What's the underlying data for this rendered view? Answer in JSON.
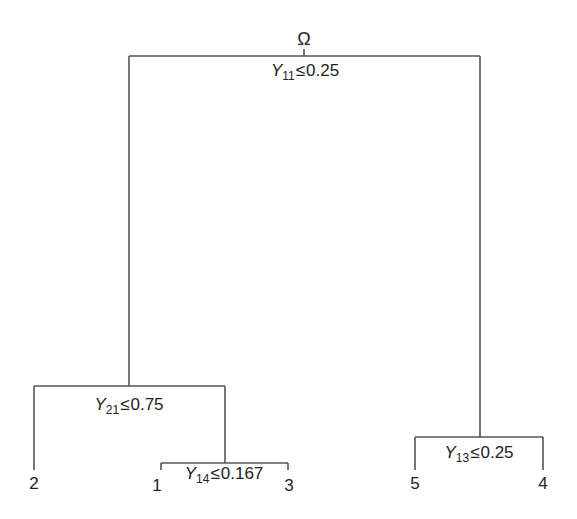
{
  "diagram": {
    "type": "decision-tree",
    "root": {
      "label": "Ω",
      "split": {
        "variable": "Y",
        "index": "11",
        "operator": "≤",
        "threshold": "0.25"
      }
    },
    "nodes": {
      "left": {
        "split": {
          "variable": "Y",
          "index": "21",
          "operator": "≤",
          "threshold": "0.75"
        }
      },
      "left_right": {
        "split": {
          "variable": "Y",
          "index": "14",
          "operator": "≤",
          "threshold": "0.167"
        }
      },
      "right": {
        "split": {
          "variable": "Y",
          "index": "13",
          "operator": "≤",
          "threshold": "0.25"
        }
      }
    },
    "leaves": [
      {
        "id": "leaf-2",
        "label": "2"
      },
      {
        "id": "leaf-1",
        "label": "1"
      },
      {
        "id": "leaf-3",
        "label": "3"
      },
      {
        "id": "leaf-5",
        "label": "5"
      },
      {
        "id": "leaf-4",
        "label": "4"
      }
    ],
    "line_color": "#555555"
  }
}
